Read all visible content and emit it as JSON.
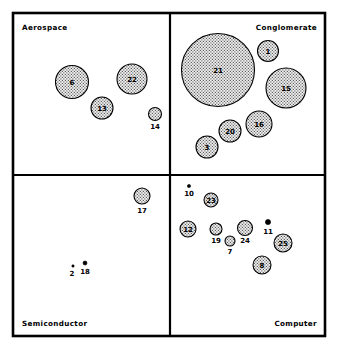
{
  "chart_data": {
    "type": "scatter",
    "title": "",
    "subtitle": "",
    "xlabel": "",
    "ylabel": "",
    "grid": false,
    "legend_position": "none",
    "quadrant_labels": [
      {
        "id": "aerospace",
        "text": "Aerospace",
        "corner": "top-left"
      },
      {
        "id": "conglomerate",
        "text": "Conglomerate",
        "corner": "top-right"
      },
      {
        "id": "semiconductor",
        "text": "Semiconductor",
        "corner": "bottom-left"
      },
      {
        "id": "computer",
        "text": "Computer",
        "corner": "bottom-right"
      }
    ],
    "quadrant_divider_x": 170,
    "quadrant_divider_y": 175,
    "plot_bounds": {
      "x0": 13,
      "y0": 13,
      "x1": 325,
      "y1": 336
    },
    "bubble_fill": "#d8d8d8",
    "bubble_stroke": "#000000",
    "points": [
      {
        "label": "6",
        "quadrant": "Aerospace",
        "cx": 72,
        "cy": 82,
        "r": 16.5,
        "label_dx": 0,
        "label_dy": 2.5
      },
      {
        "label": "22",
        "quadrant": "Aerospace",
        "cx": 132,
        "cy": 79,
        "r": 15.0,
        "label_dx": 0,
        "label_dy": 2.5
      },
      {
        "label": "13",
        "quadrant": "Aerospace",
        "cx": 102,
        "cy": 108,
        "r": 11.0,
        "label_dx": 0,
        "label_dy": 2.5
      },
      {
        "label": "14",
        "quadrant": "Aerospace",
        "cx": 155,
        "cy": 114,
        "r": 6.5,
        "label_dx": 0,
        "label_dy": 15
      },
      {
        "label": "21",
        "quadrant": "Conglomerate",
        "cx": 218,
        "cy": 70,
        "r": 36.5,
        "label_dx": 0,
        "label_dy": 2.5
      },
      {
        "label": "1",
        "quadrant": "Conglomerate",
        "cx": 268,
        "cy": 51,
        "r": 10.5,
        "label_dx": 0,
        "label_dy": 2.5
      },
      {
        "label": "15",
        "quadrant": "Conglomerate",
        "cx": 286,
        "cy": 88,
        "r": 20.0,
        "label_dx": 0,
        "label_dy": 2.5
      },
      {
        "label": "16",
        "quadrant": "Conglomerate",
        "cx": 259,
        "cy": 124,
        "r": 13.0,
        "label_dx": 0,
        "label_dy": 2.5
      },
      {
        "label": "20",
        "quadrant": "Conglomerate",
        "cx": 230,
        "cy": 131,
        "r": 11.0,
        "label_dx": 0,
        "label_dy": 2.5
      },
      {
        "label": "3",
        "quadrant": "Conglomerate",
        "cx": 207,
        "cy": 147,
        "r": 11.0,
        "label_dx": 0,
        "label_dy": 2.5
      },
      {
        "label": "17",
        "quadrant": "Semiconductor",
        "cx": 142,
        "cy": 196,
        "r": 8.0,
        "label_dx": 0,
        "label_dy": 17
      },
      {
        "label": "2",
        "quadrant": "Semiconductor",
        "cx": 73,
        "cy": 266,
        "r": 1.2,
        "label_dx": -1,
        "label_dy": 10
      },
      {
        "label": "18",
        "quadrant": "Semiconductor",
        "cx": 85,
        "cy": 263,
        "r": 2.0,
        "label_dx": 0,
        "label_dy": 11
      },
      {
        "label": "10",
        "quadrant": "Computer",
        "cx": 189,
        "cy": 186,
        "r": 1.6,
        "label_dx": 0,
        "label_dy": 10
      },
      {
        "label": "23",
        "quadrant": "Computer",
        "cx": 211,
        "cy": 200,
        "r": 7.0,
        "label_dx": 0,
        "label_dy": 2.5
      },
      {
        "label": "12",
        "quadrant": "Computer",
        "cx": 188,
        "cy": 229,
        "r": 8.0,
        "label_dx": 0,
        "label_dy": 2.5
      },
      {
        "label": "19",
        "quadrant": "Computer",
        "cx": 216,
        "cy": 229,
        "r": 6.0,
        "label_dx": 0,
        "label_dy": 14
      },
      {
        "label": "7",
        "quadrant": "Computer",
        "cx": 230,
        "cy": 241,
        "r": 5.0,
        "label_dx": 0,
        "label_dy": 13
      },
      {
        "label": "24",
        "quadrant": "Computer",
        "cx": 245,
        "cy": 228,
        "r": 7.5,
        "label_dx": 0,
        "label_dy": 15
      },
      {
        "label": "11",
        "quadrant": "Computer",
        "cx": 268,
        "cy": 222,
        "r": 2.6,
        "label_dx": 0,
        "label_dy": 12
      },
      {
        "label": "25",
        "quadrant": "Computer",
        "cx": 283,
        "cy": 243,
        "r": 9.0,
        "label_dx": 0,
        "label_dy": 2.5
      },
      {
        "label": "8",
        "quadrant": "Computer",
        "cx": 262,
        "cy": 265,
        "r": 9.0,
        "label_dx": 0,
        "label_dy": 2.5
      }
    ]
  }
}
